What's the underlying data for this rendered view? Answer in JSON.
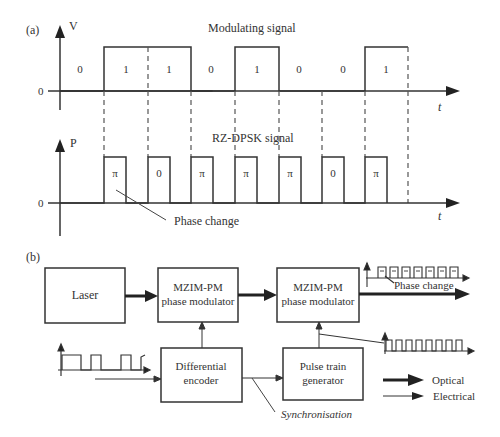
{
  "panel_a": {
    "label": "(a)",
    "modulating": {
      "title": "Modulating signal",
      "y_axis_label": "V",
      "zero_label": "0",
      "x_axis_label": "t",
      "bits": [
        "0",
        "1",
        "1",
        "0",
        "1",
        "0",
        "0",
        "1"
      ]
    },
    "rz_dpsk": {
      "title": "RZ-DPSK signal",
      "y_axis_label": "P",
      "zero_label": "0",
      "x_axis_label": "t",
      "phases": [
        "π",
        "0",
        "π",
        "π",
        "π",
        "0",
        "π"
      ],
      "annotation": "Phase change"
    }
  },
  "panel_b": {
    "label": "(b)",
    "blocks": {
      "laser": "Laser",
      "mzim1_line1": "MZIM-PM",
      "mzim1_line2": "phase modulator",
      "mzim2_line1": "MZIM-PM",
      "mzim2_line2": "phase modulator",
      "encoder_line1": "Differential",
      "encoder_line2": "encoder",
      "pulse_line1": "Pulse train",
      "pulse_line2": "generator"
    },
    "output_annotation": "Phase change",
    "sync_label": "Synchronisation",
    "legend": {
      "optical": "Optical",
      "electrical": "Electrical"
    }
  }
}
